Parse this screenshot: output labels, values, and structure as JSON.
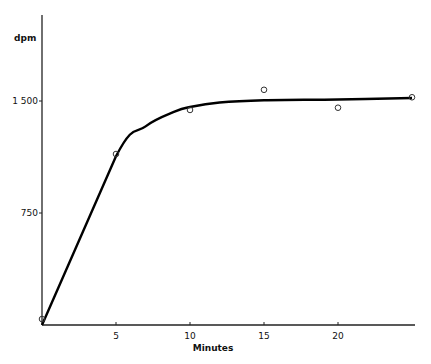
{
  "chart_data": {
    "type": "line",
    "title": "",
    "xlabel": "Minutes",
    "ylabel": "dpm",
    "x_ticks": [
      "5",
      "10",
      "15",
      "20"
    ],
    "y_ticks": [
      "750",
      "1 500"
    ],
    "xlim": [
      0,
      25
    ],
    "ylim": [
      0,
      2100
    ],
    "grid": false,
    "legend": null,
    "series": [
      {
        "name": "observed",
        "style": "open-circles",
        "x": [
          0,
          5,
          10,
          15,
          20,
          25
        ],
        "y": [
          40,
          1145,
          1440,
          1575,
          1455,
          1525
        ]
      },
      {
        "name": "fitted curve",
        "style": "solid-line",
        "x": [
          0,
          5,
          7,
          9,
          10,
          12,
          15,
          20,
          25
        ],
        "y": [
          0,
          1130,
          1330,
          1430,
          1460,
          1490,
          1505,
          1510,
          1520
        ]
      }
    ]
  }
}
